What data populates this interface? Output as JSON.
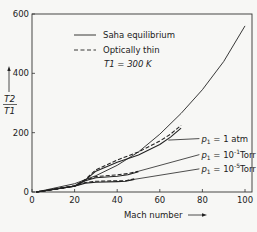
{
  "chart_data": {
    "type": "line",
    "title": "",
    "xlabel": "Mach number",
    "ylabel": "T2/T1",
    "ylabel_num": "T2",
    "ylabel_den": "T1",
    "xlim": [
      0,
      100
    ],
    "ylim": [
      0,
      600
    ],
    "x_ticks": [
      0,
      20,
      40,
      60,
      80,
      100
    ],
    "y_ticks": [
      0,
      200,
      400,
      600
    ],
    "x_tick_labels": [
      "0",
      "20",
      "40",
      "60",
      "80",
      "100"
    ],
    "y_tick_labels": [
      "0",
      "200",
      "400",
      "600"
    ],
    "grid": false,
    "legend": {
      "placement": "top-left",
      "entries": [
        {
          "label": "Saha equilibrium",
          "style": "solid"
        },
        {
          "label": "Optically thin",
          "style": "dashed"
        }
      ],
      "condition": "T1 = 300 K"
    },
    "series": [
      {
        "name": "Frozen (no dissociation/ionization)",
        "style": "solid",
        "x": [
          2,
          20,
          30,
          40,
          50,
          60,
          70,
          80,
          90,
          100
        ],
        "y": [
          0,
          28,
          55,
          90,
          135,
          195,
          265,
          345,
          440,
          560
        ]
      },
      {
        "name": "p1 = 1 atm, Saha equilibrium",
        "style": "solid",
        "group": "p1 = 1 atm",
        "x": [
          2,
          20,
          25,
          30,
          40,
          50,
          60,
          65,
          70
        ],
        "y": [
          0,
          20,
          40,
          70,
          100,
          125,
          160,
          185,
          215
        ]
      },
      {
        "name": "p1 = 1 atm, Optically thin",
        "style": "dashed",
        "group": "p1 = 1 atm",
        "x": [
          2,
          20,
          25,
          30,
          40,
          50,
          60,
          65,
          70
        ],
        "y": [
          0,
          20,
          42,
          75,
          108,
          135,
          172,
          195,
          225
        ]
      },
      {
        "name": "p1 = 10^-1 Torr, Saha equilibrium",
        "style": "solid",
        "group": "p1 = 10^-1 Torr",
        "x": [
          2,
          20,
          25,
          30,
          40,
          45,
          50
        ],
        "y": [
          0,
          20,
          38,
          48,
          53,
          58,
          68
        ]
      },
      {
        "name": "p1 = 10^-1 Torr, Optically thin",
        "style": "dashed",
        "group": "p1 = 10^-1 Torr",
        "x": [
          2,
          20,
          25,
          30,
          40,
          45,
          50
        ],
        "y": [
          0,
          20,
          40,
          52,
          58,
          62,
          70
        ]
      },
      {
        "name": "p1 = 10^-5 Torr, Saha equilibrium",
        "style": "solid",
        "group": "p1 = 10^-5 Torr",
        "x": [
          2,
          20,
          25,
          30,
          40,
          44,
          48
        ],
        "y": [
          0,
          20,
          30,
          33,
          35,
          36,
          42
        ]
      },
      {
        "name": "p1 = 10^-5 Torr, Optically thin",
        "style": "dashed",
        "group": "p1 = 10^-5 Torr",
        "x": [
          2,
          20,
          25,
          30,
          40,
          44,
          48
        ],
        "y": [
          0,
          20,
          32,
          36,
          38,
          38,
          44
        ]
      }
    ],
    "annotations": [
      {
        "text": "p1 = 1 atm",
        "p": "p",
        "sub": "1",
        "rest": "= 1 atm",
        "points_to": [
          64,
          175
        ],
        "label_at": [
          80,
          180
        ]
      },
      {
        "text": "p1 = 10^-1 Torr",
        "p": "p",
        "sub": "1",
        "base": "= 10",
        "exp": "-1",
        "unit": "Torr",
        "points_to": [
          50,
          70
        ],
        "label_at": [
          80,
          126
        ]
      },
      {
        "text": "p1 = 10^-5 Torr",
        "p": "p",
        "sub": "1",
        "base": "= 10",
        "exp": "-5",
        "unit": "Torr",
        "points_to": [
          44,
          38
        ],
        "label_at": [
          80,
          78
        ]
      }
    ]
  }
}
